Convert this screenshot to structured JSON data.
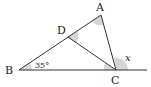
{
  "diagram": {
    "type": "geometry-triangle",
    "points": {
      "A": {
        "label": "A",
        "x": 101,
        "y": 15
      },
      "B": {
        "label": "B",
        "x": 19,
        "y": 70
      },
      "C": {
        "label": "C",
        "x": 116,
        "y": 70
      },
      "D": {
        "label": "D",
        "x": 68,
        "y": 37
      }
    },
    "angle_labels": {
      "B": "35°",
      "exterior_C": "x"
    },
    "colors": {
      "line": "#333333",
      "angle_mark": "#cfcfcf",
      "text": "#222222"
    }
  }
}
